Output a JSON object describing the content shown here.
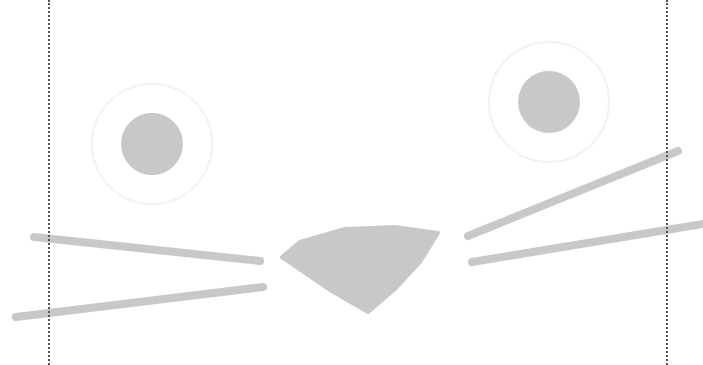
{
  "illustration": {
    "subject": "cat face",
    "canvas": {
      "width": 703,
      "height": 365,
      "background": "#ffffff"
    },
    "colors": {
      "feature_fill": "#c8c8c8",
      "eye_ring": "#f2f2f2",
      "guide_line": "#555555"
    },
    "guides": [
      {
        "name": "left-guide",
        "x": 48
      },
      {
        "name": "right-guide",
        "x": 666
      }
    ],
    "eyes": [
      {
        "name": "left-eye",
        "cx": 152,
        "cy": 144,
        "pupil_r": 31,
        "ring_r": 60
      },
      {
        "name": "right-eye",
        "cx": 549,
        "cy": 102,
        "pupil_r": 31,
        "ring_r": 60
      }
    ],
    "nose": {
      "points": "282,257 300,242 345,229 395,227 438,233 420,262 395,289 368,312 330,290"
    },
    "whiskers": [
      {
        "name": "whisker-left-upper",
        "x1": 34,
        "y1": 237,
        "x2": 260,
        "y2": 261
      },
      {
        "name": "whisker-left-lower",
        "x1": 16,
        "y1": 317,
        "x2": 263,
        "y2": 287
      },
      {
        "name": "whisker-right-upper",
        "x1": 468,
        "y1": 236,
        "x2": 678,
        "y2": 151
      },
      {
        "name": "whisker-right-lower",
        "x1": 472,
        "y1": 262,
        "x2": 703,
        "y2": 224
      }
    ]
  }
}
